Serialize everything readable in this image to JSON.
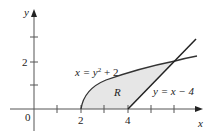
{
  "diagram": {
    "axes": {
      "x_label": "x",
      "y_label": "y",
      "origin_label": "0"
    },
    "x_ticks": [
      "2",
      "4"
    ],
    "y_ticks": [
      "2"
    ],
    "curve_label": "x = y",
    "curve_label_sup": "2",
    "curve_label_tail": " + 2",
    "line_label": "y = x − 4",
    "region_label": "R",
    "colors": {
      "axis": "#555555",
      "curve": "#333333",
      "fill": "#e6e6e6"
    }
  }
}
